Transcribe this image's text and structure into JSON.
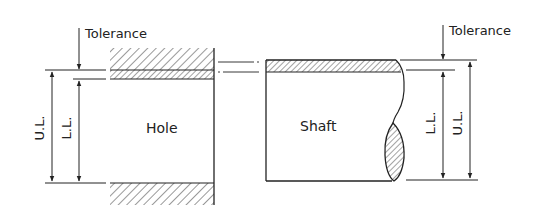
{
  "diagram": {
    "hole": {
      "label": "Hole",
      "tolerance_label": "Tolerance",
      "upper_limit_label": "U.L.",
      "lower_limit_label": "L.L."
    },
    "shaft": {
      "label": "Shaft",
      "tolerance_label": "Tolerance",
      "upper_limit_label": "U.L.",
      "lower_limit_label": "L.L."
    },
    "colors": {
      "line": "#222222",
      "background": "#ffffff"
    }
  }
}
